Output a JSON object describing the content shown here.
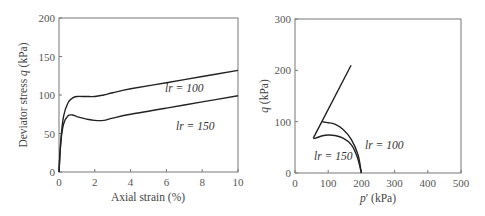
{
  "chart_data": [
    {
      "type": "line",
      "title": "",
      "xlabel": "Axial strain (%)",
      "ylabel": "Deviator stress q (kPa)",
      "xlim": [
        0,
        10
      ],
      "ylim": [
        0,
        200
      ],
      "xticks": [
        "0",
        "2",
        "4",
        "6",
        "8",
        "10"
      ],
      "yticks": [
        "0",
        "50",
        "100",
        "150",
        "200"
      ],
      "grid": false,
      "series": [
        {
          "name": "lr = 100",
          "x": [
            0,
            0.1,
            0.25,
            0.5,
            0.75,
            1.0,
            1.5,
            2.0,
            2.5,
            3.0,
            4.0,
            6.0,
            8.0,
            10.0
          ],
          "y": [
            0,
            40,
            72,
            90,
            96,
            98,
            98,
            98,
            100,
            103,
            108,
            116,
            124,
            132
          ]
        },
        {
          "name": "lr = 150",
          "x": [
            0,
            0.1,
            0.25,
            0.5,
            0.75,
            1.0,
            1.5,
            2.0,
            2.5,
            3.0,
            4.0,
            6.0,
            8.0,
            10.0
          ],
          "y": [
            0,
            38,
            62,
            73,
            74,
            72,
            69,
            67,
            67,
            70,
            75,
            83,
            91,
            99
          ]
        }
      ],
      "annotations": [
        {
          "text": "lr = 100",
          "x": 6.3,
          "y": 108
        },
        {
          "text": "lr = 150",
          "x": 6.8,
          "y": 60
        }
      ]
    },
    {
      "type": "line",
      "title": "",
      "xlabel": "p′ (kPa)",
      "ylabel": "q (kPa)",
      "xlim": [
        0,
        500
      ],
      "ylim": [
        0,
        300
      ],
      "xticks": [
        "0",
        "100",
        "200",
        "300",
        "400",
        "500"
      ],
      "yticks": [
        "0",
        "100",
        "200",
        "300"
      ],
      "grid": false,
      "series": [
        {
          "name": "lr = 100",
          "x": [
            200,
            190,
            170,
            145,
            120,
            100,
            90,
            82
          ],
          "y": [
            0,
            35,
            65,
            85,
            95,
            98,
            99,
            100
          ]
        },
        {
          "name": "lr = 150",
          "x": [
            200,
            188,
            170,
            145,
            120,
            100,
            80,
            62,
            55
          ],
          "y": [
            0,
            30,
            55,
            68,
            73,
            74,
            72,
            68,
            67
          ]
        },
        {
          "name": "critical state line",
          "x": [
            55,
            169
          ],
          "y": [
            68,
            210
          ]
        }
      ],
      "annotations": [
        {
          "text": "lr = 100",
          "x": 225,
          "y": 52
        },
        {
          "text": "lr = 150",
          "x": 60,
          "y": 33
        }
      ]
    }
  ],
  "labels": {
    "left_x": "Axial strain (%)",
    "left_y_pre": "Deviator stress ",
    "left_y_q": "q",
    "left_y_post": " (kPa)",
    "right_x_p": "p",
    "right_x_post": "′ (kPa)",
    "right_y_q": "q",
    "right_y_post": " (kPa)",
    "ann_l100": "lr = 100",
    "ann_l150": "lr = 150",
    "ann_r100": "lr = 100",
    "ann_r150": "lr = 150"
  }
}
